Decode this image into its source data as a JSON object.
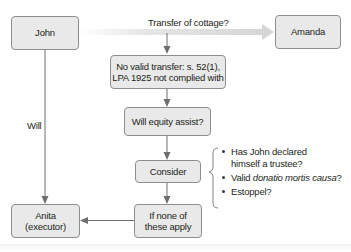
{
  "nodes": {
    "john": "John",
    "amanda": "Amanda",
    "no_valid_transfer": [
      "No valid transfer: s. 52(1),",
      "LPA 1925 not complied with"
    ],
    "will_equity_assist": "Will equity assist?",
    "consider": "Consider",
    "if_none_apply": [
      "If none of",
      "these apply"
    ],
    "anita": [
      "Anita",
      "(executor)"
    ]
  },
  "edge_labels": {
    "transfer": "Transfer of cottage?",
    "will": "Will"
  },
  "considerations": [
    {
      "lines": [
        "Has John declared",
        "himself a trustee?"
      ]
    },
    {
      "prefix": "Valid ",
      "italic": "donatio mortis causa",
      "suffix": "?"
    },
    {
      "lines": [
        "Estoppel?"
      ]
    }
  ],
  "colors": {
    "box_fill": "#e9e9e9",
    "box_border": "#8e8e8e",
    "arrow": "#6e6e6e",
    "transfer_arrow_light": "#d8d8d8"
  }
}
